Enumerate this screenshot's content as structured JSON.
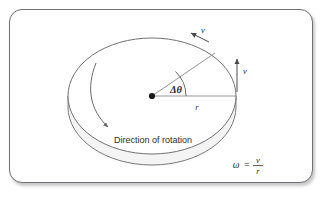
{
  "figure": {
    "name": "rotating-disk-angular-velocity-diagram",
    "caption_text": "Direction of rotation",
    "angle_label": "Δθ",
    "radius_label": "r",
    "velocity_label_tangential": "v",
    "velocity_label_edge": "v",
    "formula": {
      "omega": "ω",
      "equals": "=",
      "numerator": "v",
      "denominator": "r"
    }
  },
  "colors": {
    "frame_border": "#6f6f72",
    "disk_outline": "#6a6a6e",
    "line": "#8a8a8e",
    "text": "#2b2b2b",
    "background": "#ffffff",
    "disk_edge_fill": "#f2f2f2"
  },
  "geometry": {
    "disk_center_x": 152,
    "disk_center_y": 96,
    "disk_radius_x": 84,
    "disk_radius_y": 58,
    "disk_thickness": 11,
    "radius_end_x": 236,
    "radius_end_y": 96,
    "angle_degrees": 38
  }
}
